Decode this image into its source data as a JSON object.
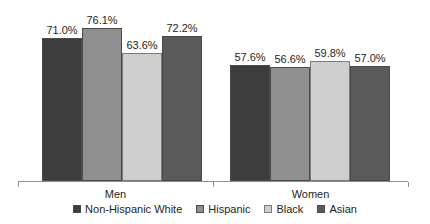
{
  "chart_data": {
    "type": "bar",
    "title": "",
    "subtitle": "",
    "xlabel": "",
    "ylabel": "",
    "categories": [
      "Men",
      "Women"
    ],
    "series": [
      {
        "name": "Non-Hispanic White",
        "color": "#3d3d3d",
        "values": [
          71.0,
          57.6
        ],
        "labels": [
          "71.0%",
          "57.6%"
        ]
      },
      {
        "name": "Hispanic",
        "color": "#8f8f8f",
        "values": [
          76.1,
          56.6
        ],
        "labels": [
          "76.1%",
          "56.6%"
        ]
      },
      {
        "name": "Black",
        "color": "#cfcfcf",
        "values": [
          63.6,
          59.8
        ],
        "labels": [
          "63.6%",
          "59.8%"
        ]
      },
      {
        "name": "Asian",
        "color": "#5a5a5a",
        "values": [
          72.2,
          57.0
        ],
        "labels": [
          "72.2%",
          "57.0%"
        ]
      }
    ],
    "ylim": [
      0,
      90
    ],
    "grid": false,
    "yaxis_visible": false,
    "legend_position": "bottom",
    "value_labels_shown": true,
    "units": "percent"
  },
  "axis": {
    "men_label": "Men",
    "women_label": "Women"
  },
  "legend": {
    "items": [
      {
        "label": "Non-Hispanic White"
      },
      {
        "label": "Hispanic"
      },
      {
        "label": "Black"
      },
      {
        "label": "Asian"
      }
    ]
  }
}
